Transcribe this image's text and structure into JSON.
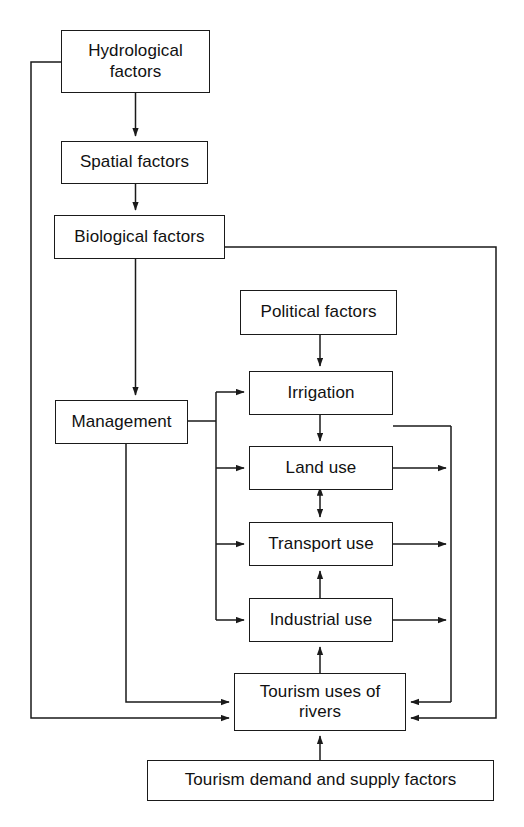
{
  "diagram": {
    "type": "flowchart",
    "background_color": "#ffffff",
    "line_color": "#1a1a1a",
    "text_color": "#111111",
    "nodes": [
      {
        "id": "hydrological",
        "label": "Hydrological\nfactors"
      },
      {
        "id": "spatial",
        "label": "Spatial factors"
      },
      {
        "id": "biological",
        "label": "Biological factors"
      },
      {
        "id": "management",
        "label": "Management"
      },
      {
        "id": "political",
        "label": "Political factors"
      },
      {
        "id": "irrigation",
        "label": "Irrigation"
      },
      {
        "id": "landuse",
        "label": "Land use"
      },
      {
        "id": "transport",
        "label": "Transport use"
      },
      {
        "id": "industrial",
        "label": "Industrial use"
      },
      {
        "id": "tourismuses",
        "label": "Tourism uses of\nrivers"
      },
      {
        "id": "demandsupply",
        "label": "Tourism demand and supply factors"
      }
    ],
    "edges": [
      {
        "from": "hydrological",
        "to": "spatial",
        "arrow": "single"
      },
      {
        "from": "spatial",
        "to": "biological",
        "arrow": "single"
      },
      {
        "from": "biological",
        "to": "management",
        "arrow": "single"
      },
      {
        "from": "hydrological",
        "to": "tourismuses",
        "arrow": "single"
      },
      {
        "from": "biological",
        "to": "tourismuses",
        "arrow": "single"
      },
      {
        "from": "management",
        "to": "tourismuses",
        "arrow": "single"
      },
      {
        "from": "management",
        "to": "irrigation",
        "arrow": "single"
      },
      {
        "from": "management",
        "to": "landuse",
        "arrow": "single"
      },
      {
        "from": "management",
        "to": "transport",
        "arrow": "single"
      },
      {
        "from": "management",
        "to": "industrial",
        "arrow": "single"
      },
      {
        "from": "political",
        "to": "irrigation",
        "arrow": "single"
      },
      {
        "from": "irrigation",
        "to": "landuse",
        "arrow": "single"
      },
      {
        "from": "landuse",
        "to": "transport",
        "arrow": "double"
      },
      {
        "from": "industrial",
        "to": "transport",
        "arrow": "single"
      },
      {
        "from": "tourismuses",
        "to": "industrial",
        "arrow": "single"
      },
      {
        "from": "irrigation",
        "to": "tourismuses",
        "arrow": "single"
      },
      {
        "from": "landuse",
        "to": "tourismuses",
        "arrow": "single"
      },
      {
        "from": "transport",
        "to": "tourismuses",
        "arrow": "single"
      },
      {
        "from": "industrial",
        "to": "tourismuses",
        "arrow": "single"
      },
      {
        "from": "demandsupply",
        "to": "tourismuses",
        "arrow": "single"
      }
    ]
  }
}
